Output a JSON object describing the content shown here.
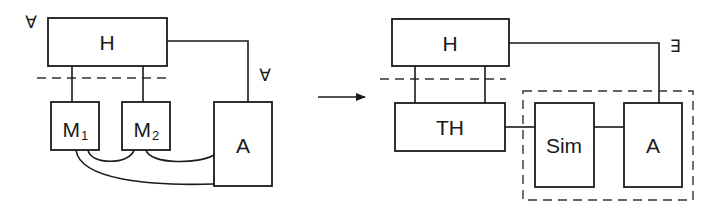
{
  "left_diagram": {
    "quantifier_top": "∀",
    "quantifier_right": "∀",
    "h_box": "H",
    "m1_box": {
      "main": "M",
      "sub": "1"
    },
    "m2_box": {
      "main": "M",
      "sub": "2"
    },
    "a_box": "A"
  },
  "arrow": {
    "direction": "right"
  },
  "right_diagram": {
    "quantifier": "∃",
    "h_box": "H",
    "th_box": "TH",
    "sim_box": "Sim",
    "a_box": "A"
  }
}
